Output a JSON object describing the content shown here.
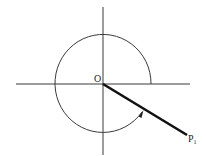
{
  "diagram": {
    "colors": {
      "background": "#ffffff",
      "stroke": "#2a2a2a"
    },
    "origin_label": "O",
    "point_label": "P",
    "point_subscript": "1",
    "elements": [
      "horizontal-axis",
      "vertical-axis",
      "rotation-arc-with-arrow",
      "ray-O-to-P1"
    ]
  }
}
